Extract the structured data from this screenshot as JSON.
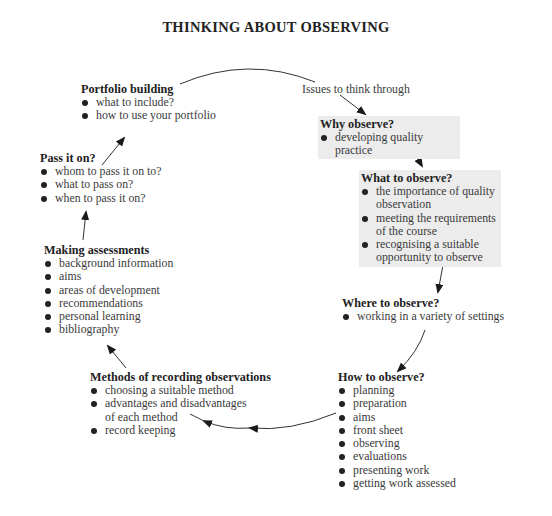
{
  "title": "THINKING ABOUT OBSERVING",
  "start_label": "Issues to think through",
  "nodes": [
    {
      "id": "why",
      "heading": "Why observe?",
      "shaded": true,
      "items": [
        "developing quality practice"
      ]
    },
    {
      "id": "what",
      "heading": "What to observe?",
      "shaded": true,
      "items": [
        "the importance of quality observation",
        "meeting the requirements of the course",
        "recognising a suitable opportunity to observe"
      ]
    },
    {
      "id": "where",
      "heading": "Where to observe?",
      "shaded": false,
      "items": [
        "working in a variety of settings"
      ]
    },
    {
      "id": "how",
      "heading": "How to observe?",
      "shaded": false,
      "items": [
        "planning",
        "preparation",
        "aims",
        "front sheet",
        "observing",
        "evaluations",
        "presenting work",
        "getting work assessed"
      ]
    },
    {
      "id": "methods",
      "heading": "Methods of recording observations",
      "shaded": false,
      "items": [
        "choosing a suitable method",
        "advantages and disadvantages of each method",
        "record keeping"
      ]
    },
    {
      "id": "assess",
      "heading": "Making assessments",
      "shaded": false,
      "items": [
        "background information",
        "aims",
        "areas of development",
        "recommendations",
        "personal learning",
        "bibliography"
      ]
    },
    {
      "id": "pass",
      "heading": "Pass it on?",
      "shaded": false,
      "items": [
        "whom to pass it on to?",
        "what to pass on?",
        "when to pass it on?"
      ]
    },
    {
      "id": "portfolio",
      "heading": "Portfolio building",
      "shaded": false,
      "items": [
        "what to include?",
        "how to use your portfolio"
      ]
    }
  ],
  "flow": [
    "Issues to think through",
    "Why observe?",
    "What to observe?",
    "Where to observe?",
    "How to observe?",
    "Methods of recording observations",
    "Making assessments",
    "Pass it on?",
    "Portfolio building",
    "Issues to think through"
  ]
}
